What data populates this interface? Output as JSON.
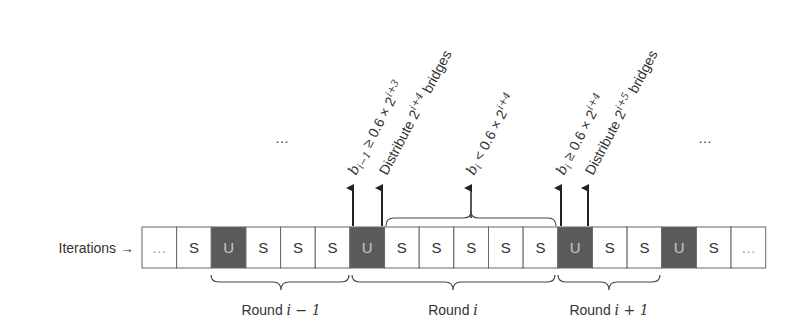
{
  "diagram": {
    "row_label": "Iterations →",
    "cells": [
      {
        "text": "…",
        "type": "ellipsis"
      },
      {
        "text": "S",
        "type": "S"
      },
      {
        "text": "U",
        "type": "U"
      },
      {
        "text": "S",
        "type": "S"
      },
      {
        "text": "S",
        "type": "S"
      },
      {
        "text": "S",
        "type": "S"
      },
      {
        "text": "U",
        "type": "U"
      },
      {
        "text": "S",
        "type": "S"
      },
      {
        "text": "S",
        "type": "S"
      },
      {
        "text": "S",
        "type": "S"
      },
      {
        "text": "S",
        "type": "S"
      },
      {
        "text": "S",
        "type": "S"
      },
      {
        "text": "U",
        "type": "U"
      },
      {
        "text": "S",
        "type": "S"
      },
      {
        "text": "S",
        "type": "S"
      },
      {
        "text": "U",
        "type": "U"
      },
      {
        "text": "S",
        "type": "S"
      },
      {
        "text": "…",
        "type": "ellipsis"
      }
    ],
    "rounds": [
      {
        "label_prefix": "Round ",
        "label_math": "i − 1"
      },
      {
        "label_prefix": "Round ",
        "label_math": "i"
      },
      {
        "label_prefix": "Round ",
        "label_math": "i + 1"
      }
    ],
    "annotations": [
      {
        "id": "cond1",
        "text_var": "b",
        "text_sub": "i−1",
        "text_rel": " ≥ 0.6 × 2",
        "text_sup": "i+3"
      },
      {
        "id": "dist1",
        "text_pre": "Distribute 2",
        "text_sup": "i+4",
        "text_post": " bridges"
      },
      {
        "id": "cond2",
        "text_var": "b",
        "text_sub": "i",
        "text_rel": " < 0.6 × 2",
        "text_sup": "i+4"
      },
      {
        "id": "cond3",
        "text_var": "b",
        "text_sub": "i",
        "text_rel": " ≥ 0.6 × 2",
        "text_sup": "i+4"
      },
      {
        "id": "dist2",
        "text_pre": "Distribute 2",
        "text_sup": "i+5",
        "text_post": " bridges"
      }
    ],
    "ellipses_top": [
      "…",
      "…"
    ],
    "colors": {
      "U_fill": "#5a5a5a",
      "U_text": "#c8c8c8",
      "S_fill": "#ffffff",
      "border": "#666666",
      "arrow": "#222222",
      "text": "#333333"
    }
  }
}
